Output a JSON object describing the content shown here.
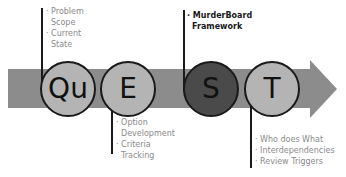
{
  "diagram": {
    "colors": {
      "arrow": "#8c8c8c",
      "circle_light": "#b4b4b4",
      "circle_dark": "#4a4a4a",
      "outline": "#1a1a1a",
      "note_text": "#8a8a8a"
    },
    "stages": [
      {
        "letter": "Qu",
        "style": "light"
      },
      {
        "letter": "E",
        "style": "light"
      },
      {
        "letter": "S",
        "style": "dark"
      },
      {
        "letter": "T",
        "style": "light"
      }
    ],
    "notes": {
      "qu": [
        "· Problem",
        "  Scope",
        "· Current",
        "  State"
      ],
      "e": [
        "· Option",
        "  Development",
        "· Criteria",
        "  Tracking"
      ],
      "s": [
        "· MurderBoard",
        "  Framework"
      ],
      "t": [
        "· Who does What",
        "· Interdependencies",
        "· Review Triggers"
      ]
    }
  }
}
